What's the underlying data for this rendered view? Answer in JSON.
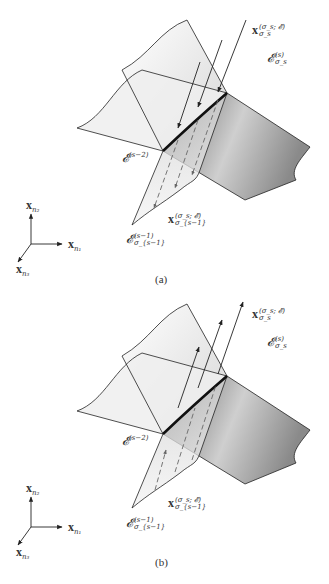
{
  "figure": {
    "panels": [
      {
        "id": "a",
        "caption": "(a)",
        "arrow_direction": "down",
        "labels": {
          "x_top": {
            "base": "x",
            "sup": "(σ_s; 𝓔)",
            "sub": "σ_s"
          },
          "e_sigma_s": {
            "base": "𝓔",
            "sup": "(s)",
            "sub": "σ_s"
          },
          "e_s_minus_2": {
            "base": "𝓔",
            "sup": "(s−2)"
          },
          "x_bottom": {
            "base": "x",
            "sup": "(σ_s; 𝓔)",
            "sub": "σ_{s−1}"
          },
          "e_sigma_s_minus_1": {
            "base": "𝓔",
            "sup": "(s−1)",
            "sub": "σ_{s−1}"
          }
        },
        "axes": {
          "up": {
            "base": "x",
            "sub": "n₂"
          },
          "right": {
            "base": "x",
            "sub": "n₁"
          },
          "diag": {
            "base": "x",
            "sub": "n₃"
          }
        }
      },
      {
        "id": "b",
        "caption": "(b)",
        "arrow_direction": "up",
        "labels": {
          "x_top": {
            "base": "x",
            "sup": "(σ_s; 𝓔)",
            "sub": "σ_s"
          },
          "e_sigma_s": {
            "base": "𝓔",
            "sup": "(s)",
            "sub": "σ_s"
          },
          "e_s_minus_2": {
            "base": "𝓔",
            "sup": "(s−2)"
          },
          "x_bottom": {
            "base": "x",
            "sup": "(σ_s; 𝓔)",
            "sub": "σ_{s−1}"
          },
          "e_sigma_s_minus_1": {
            "base": "𝓔",
            "sup": "(s−1)",
            "sub": "σ_{s−1}"
          }
        },
        "axes": {
          "up": {
            "base": "x",
            "sub": "n₂"
          },
          "right": {
            "base": "x",
            "sub": "n₁"
          },
          "diag": {
            "base": "x",
            "sub": "n₃"
          }
        }
      }
    ],
    "colors": {
      "line": "#222222",
      "sheet_light": "#f2f2f2",
      "sheet_mid": "#d8d8d8",
      "sheet_dark": "#7a7a7a",
      "dashed": "#555555"
    }
  }
}
